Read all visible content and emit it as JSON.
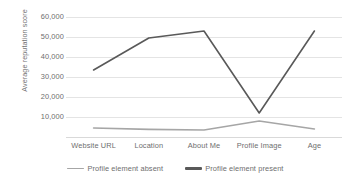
{
  "chart_data": {
    "type": "line",
    "title": "",
    "xlabel": "",
    "ylabel": "Average reputation score",
    "categories": [
      "Website URL",
      "Location",
      "About Me",
      "Profile Image",
      "Age"
    ],
    "series": [
      {
        "name": "Profile element absent",
        "color": "#a6a6a6",
        "values": [
          4500,
          3800,
          3500,
          8000,
          4000
        ]
      },
      {
        "name": "Profile element present",
        "color": "#595959",
        "values": [
          33500,
          49500,
          53000,
          12000,
          53000
        ]
      }
    ],
    "ylim": [
      0,
      60000
    ],
    "ytick_labels": [
      "60,000",
      "50,000",
      "40,000",
      "30,000",
      "20,000",
      "10,000"
    ],
    "ytick_values": [
      60000,
      50000,
      40000,
      30000,
      20000,
      10000
    ],
    "grid": true,
    "legend_position": "bottom"
  }
}
